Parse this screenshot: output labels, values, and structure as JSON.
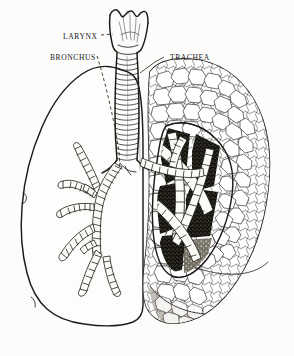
{
  "figure": {
    "background_color": "#fcfcfb",
    "ink_color": "#1d1b19",
    "width": 294,
    "height": 356,
    "style": "vintage engraved line illustration, black ink on off-white paper"
  },
  "labels": [
    {
      "id": "larynx",
      "text": "LARYNX",
      "x": 63,
      "y": 37,
      "leader_style": "dashed-short",
      "points_to": "larynx-structure"
    },
    {
      "id": "bronchus",
      "text": "BRONCHUS",
      "x": 50,
      "y": 58,
      "leader_style": "long-dashed",
      "points_to": "left-bronchial-tree"
    },
    {
      "id": "trachea",
      "text": "TRACHEA",
      "x": 166,
      "y": 58,
      "leader_style": "short-angled",
      "points_to": "trachea-tube"
    }
  ],
  "structures": {
    "larynx": {
      "name": "larynx",
      "description": "funnel-shaped voice box with scalloped superior rim",
      "rendering": "outline with wavy crest and internal shading"
    },
    "trachea": {
      "name": "trachea",
      "description": "vertical windpipe",
      "cartilage_ring_count": 22,
      "rendering": "stacked horizontal cartilage rings"
    },
    "left_lung": {
      "name": "left lung (viewer left)",
      "rendering": "plain outline, interior left blank to expose bronchial tree",
      "lobes_visible": 2,
      "contains": "bronchial tree"
    },
    "bronchial_tree": {
      "name": "bronchial tree",
      "description": "ringed branching airways descending from the carina",
      "branch_count": 14,
      "rendering": "segmented tubes drawn with transverse rings"
    },
    "right_lung": {
      "name": "right lung (viewer right)",
      "rendering": "dense polygonal lobule stippling with sectioned cut-away",
      "lobes_visible": 3,
      "cutaway": "dark stippled cavity revealing interior bronchi"
    }
  },
  "legend_notes": {
    "left_side_note": "left lung drawn in outline only",
    "right_side_note": "right lung drawn with surface lobules and dissected window"
  }
}
